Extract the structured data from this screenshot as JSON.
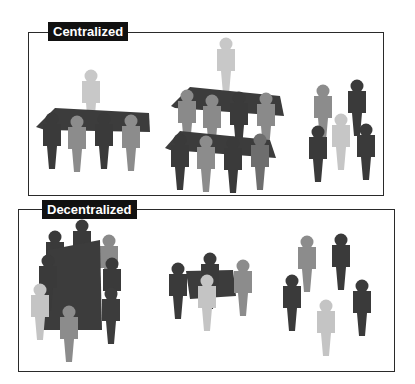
{
  "panels": [
    {
      "id": "centralized",
      "label": "Centralized",
      "groups": [
        {
          "name": "single-level-hierarchy",
          "description": "one leader above a single team sharing a table"
        },
        {
          "name": "multi-level-hierarchy",
          "description": "one leader above two stacked team levels"
        },
        {
          "name": "independent-individuals",
          "description": "scattered individuals without shared structure"
        }
      ]
    },
    {
      "id": "decentralized",
      "label": "Decentralized",
      "groups": [
        {
          "name": "large-collaborative-cluster",
          "description": "many people gathered around a shared large surface"
        },
        {
          "name": "small-collaborative-cluster",
          "description": "small team sharing a table"
        },
        {
          "name": "independent-individuals",
          "description": "scattered individuals without shared structure"
        }
      ]
    }
  ],
  "colors": {
    "dark": "#3a3a3a",
    "medium": "#8a8a8a",
    "light": "#c4c4c4",
    "table": "#3c3c3c",
    "border": "#2a2a2a",
    "label_bg": "#111111",
    "label_text": "#ffffff"
  }
}
